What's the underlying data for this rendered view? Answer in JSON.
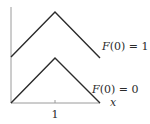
{
  "chart_data": {
    "type": "line",
    "title": "",
    "xlabel": "x",
    "ylabel": "",
    "x_ticks": [
      1
    ],
    "x_tick_labels": [
      "1"
    ],
    "xlim": [
      0,
      2
    ],
    "ylim": [
      0,
      2
    ],
    "grid": false,
    "legend": "inline annotations on right",
    "series": [
      {
        "name": "F(0) = 1",
        "x": [
          0,
          1,
          2
        ],
        "y": [
          1,
          2,
          1
        ]
      },
      {
        "name": "F(0) = 0",
        "x": [
          0,
          1,
          2
        ],
        "y": [
          0,
          1,
          0
        ]
      }
    ],
    "annotations": [
      "F(0) = 1",
      "F(0) = 0"
    ]
  },
  "labels": {
    "x_axis": "x",
    "tick_1": "1",
    "upper_curve": "F(0) = 1",
    "lower_curve": "F(0) = 0"
  },
  "colors": {
    "curve": "#2b2b2b",
    "axis": "#9a9a9a",
    "background": "#ffffff"
  }
}
